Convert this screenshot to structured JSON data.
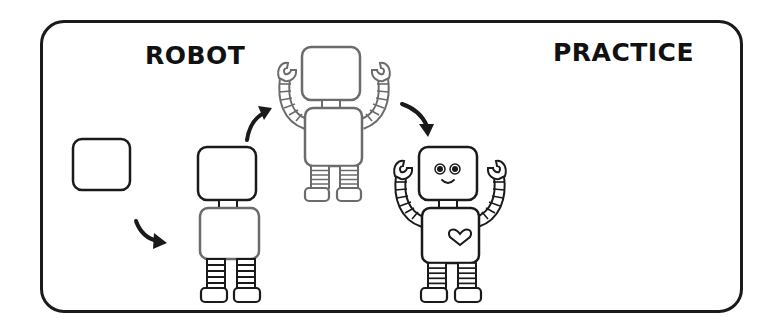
{
  "worksheet": {
    "title_left": "ROBOT",
    "title_right": "PRACTICE"
  },
  "steps": [
    {
      "index": 1,
      "description": "draw a rounded square head"
    },
    {
      "index": 2,
      "description": "add neck, body, legs and feet"
    },
    {
      "index": 3,
      "description": "add arms with claw hands"
    },
    {
      "index": 4,
      "description": "add face and heart"
    }
  ],
  "colors": {
    "stroke_dark": "#1a1a1a",
    "stroke_gray": "#6b6b6b",
    "background": "#ffffff"
  }
}
